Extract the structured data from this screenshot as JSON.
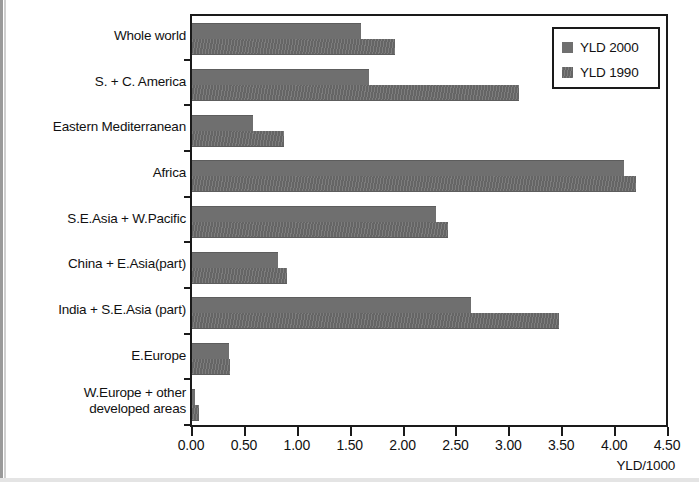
{
  "chart_data": {
    "type": "bar",
    "orientation": "horizontal",
    "title": "",
    "xlabel": "YLD/1000",
    "ylabel": "",
    "xlim": [
      0.0,
      4.5
    ],
    "xticks": [
      "0.00",
      "0.50",
      "1.00",
      "1.50",
      "2.00",
      "2.50",
      "3.00",
      "3.50",
      "4.00",
      "4.50"
    ],
    "xtick_values": [
      0.0,
      0.5,
      1.0,
      1.5,
      2.0,
      2.5,
      3.0,
      3.5,
      4.0,
      4.5
    ],
    "grid": false,
    "legend_position": "top-right",
    "categories": [
      "Whole world",
      "S. + C. America",
      "Eastern Mediterranean",
      "Africa",
      "S.E.Asia + W.Pacific",
      "China + E.Asia(part)",
      "India + S.E.Asia (part)",
      "E.Europe",
      "W.Europe + other developed areas"
    ],
    "series": [
      {
        "name": "YLD 2000",
        "color": "#6f6f6f",
        "values": [
          1.6,
          1.67,
          0.58,
          4.08,
          2.31,
          0.81,
          2.64,
          0.35,
          0.03
        ]
      },
      {
        "name": "YLD 1990",
        "color": "#7a7a7a",
        "values": [
          1.92,
          3.09,
          0.87,
          4.2,
          2.42,
          0.9,
          3.47,
          0.36,
          0.07
        ]
      }
    ]
  },
  "legend": {
    "items": [
      {
        "label": "YLD 2000",
        "swatch": "legend-swatch-2000"
      },
      {
        "label": "YLD 1990",
        "swatch": "legend-swatch-1990"
      }
    ]
  },
  "axis": {
    "x_title": "YLD/1000"
  }
}
